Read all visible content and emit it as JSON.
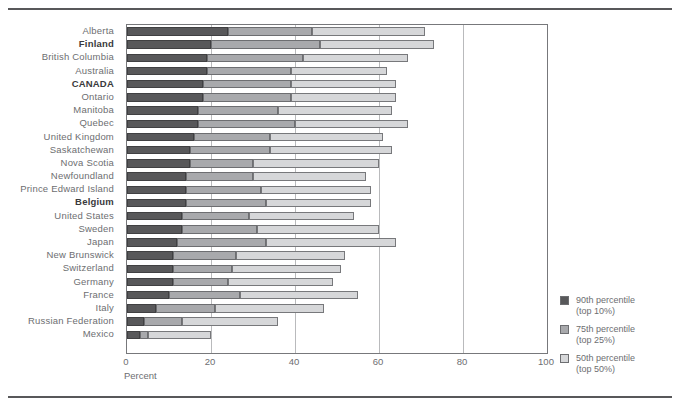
{
  "figure": {
    "axis_title": "Percent",
    "x_ticks": [
      "0",
      "20",
      "40",
      "60",
      "80",
      "100"
    ]
  },
  "legend": {
    "items": [
      {
        "key": "p90",
        "line1": "90th percentile",
        "line2": "(top 10%)",
        "color": "#58585a",
        "swatch": "swatch-90th"
      },
      {
        "key": "p75",
        "line1": "75th percentile",
        "line2": "(top 25%)",
        "color": "#a8a9ac",
        "swatch": "swatch-75th"
      },
      {
        "key": "p50",
        "line1": "50th percentile",
        "line2": "(top 50%)",
        "color": "#d6d7d9",
        "swatch": "swatch-50th"
      }
    ]
  },
  "chart_data": {
    "type": "bar",
    "orientation": "horizontal",
    "stacked": true,
    "title": "",
    "xlabel": "Percent",
    "ylabel": "",
    "xlim": [
      0,
      100
    ],
    "xticks": [
      0,
      20,
      40,
      60,
      80,
      100
    ],
    "grid": "vertical",
    "legend_position": "right",
    "categories": [
      "Alberta",
      "Finland",
      "British Columbia",
      "Australia",
      "CANADA",
      "Ontario",
      "Manitoba",
      "Quebec",
      "United Kingdom",
      "Saskatchewan",
      "Nova Scotia",
      "Newfoundland",
      "Prince Edward Island",
      "Belgium",
      "United States",
      "Sweden",
      "Japan",
      "New Brunswick",
      "Switzerland",
      "Germany",
      "France",
      "Italy",
      "Russian Federation",
      "Mexico"
    ],
    "highlighted_categories": [
      "Finland",
      "CANADA",
      "Belgium"
    ],
    "series": [
      {
        "name": "90th percentile (top 10%)",
        "color": "#58585a",
        "values": [
          24,
          20,
          19,
          19,
          18,
          18,
          17,
          17,
          16,
          15,
          15,
          14,
          14,
          14,
          13,
          13,
          12,
          11,
          11,
          11,
          10,
          7,
          4,
          3
        ]
      },
      {
        "name": "75th percentile (top 25%)",
        "color": "#a8a9ac",
        "values": [
          20,
          26,
          23,
          20,
          21,
          21,
          19,
          23,
          18,
          19,
          15,
          16,
          18,
          19,
          16,
          18,
          21,
          15,
          14,
          13,
          17,
          14,
          9,
          2
        ]
      },
      {
        "name": "50th percentile (top 50%)",
        "color": "#d6d7d9",
        "values": [
          27,
          27,
          25,
          23,
          25,
          25,
          27,
          27,
          27,
          29,
          30,
          27,
          26,
          25,
          25,
          29,
          31,
          26,
          26,
          25,
          28,
          26,
          23,
          15
        ]
      }
    ],
    "totals": [
      71,
      73,
      67,
      62,
      64,
      64,
      63,
      67,
      61,
      63,
      60,
      57,
      58,
      58,
      54,
      60,
      64,
      52,
      51,
      49,
      55,
      47,
      36,
      20
    ]
  }
}
